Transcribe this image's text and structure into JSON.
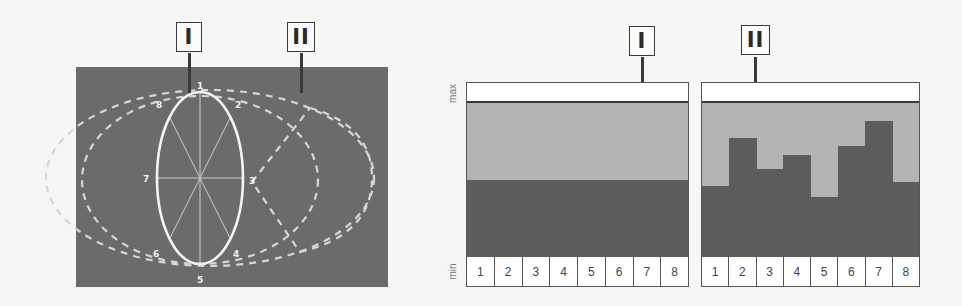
{
  "colors": {
    "background": "#f6f6f4",
    "panel_dark": "#6b6b6b",
    "bar_dark": "#5c5c5c",
    "range_light": "#b4b4b4",
    "outline": "#3a3a3a",
    "white": "#ffffff"
  },
  "left_diagram": {
    "labels": [
      {
        "id": "I",
        "text": "I"
      },
      {
        "id": "II",
        "text": "II"
      }
    ],
    "ellipse_points": [
      "1",
      "2",
      "3",
      "4",
      "5",
      "6",
      "7",
      "8"
    ]
  },
  "axis": {
    "max_label": "max",
    "min_label": "min"
  },
  "chart_data": [
    {
      "type": "bar",
      "title": "I",
      "categories": [
        "1",
        "2",
        "3",
        "4",
        "5",
        "6",
        "7",
        "8"
      ],
      "values": [
        50,
        50,
        50,
        50,
        50,
        50,
        50,
        50
      ],
      "xlabel": "",
      "ylabel": "min – max",
      "ylim": [
        0,
        100
      ],
      "ytick_labels": [
        "min",
        "max"
      ],
      "grid": false,
      "note": "uniform level across all 8 positions; light band shows full min–max range"
    },
    {
      "type": "bar",
      "title": "II",
      "categories": [
        "1",
        "2",
        "3",
        "4",
        "5",
        "6",
        "7",
        "8"
      ],
      "values": [
        46,
        77,
        57,
        66,
        39,
        72,
        88,
        49
      ],
      "xlabel": "",
      "ylabel": "min – max",
      "ylim": [
        0,
        100
      ],
      "ytick_labels": [
        "min",
        "max"
      ],
      "grid": false,
      "note": "varying level across the 8 positions"
    }
  ]
}
